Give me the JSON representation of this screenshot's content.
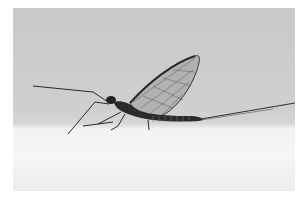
{
  "image": {
    "subject": "mayfly",
    "description": "Side view of a mayfly with upright translucent veined wings, long antennae-like forelegs and long tail filaments, perched on a white surface against a grey background",
    "colors": {
      "page_background": "#ffffff",
      "sky_background": "#cbcbcb",
      "surface": "#f4f4f4",
      "insect_body": "#2a2a2a",
      "wing": "#8a8a8a"
    }
  }
}
